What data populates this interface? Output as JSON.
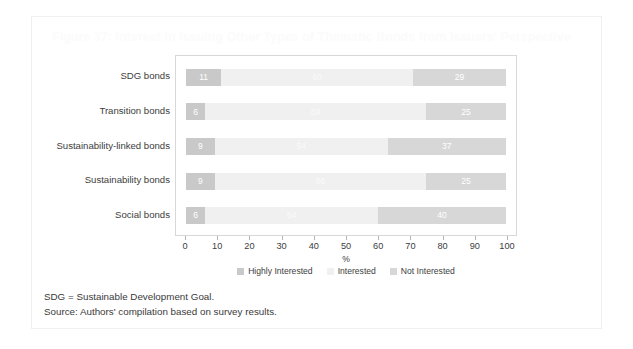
{
  "figure": {
    "title": "Figure 37: Interest in Issuing Other Types of Thematic Bonds from Issuers' Perspective",
    "notes": [
      "SDG = Sustainable Development Goal.",
      "Source: Authors' compilation based on survey results."
    ]
  },
  "colors": {
    "highly_interested": "#c9c9c9",
    "interested": "#f0f0f0",
    "not_interested": "#d7d7d7",
    "axis": "#b5b5b5",
    "text": "#3d3d3d",
    "title": "#fbfbfb",
    "panel_border": "#d8d8d8",
    "frame_border": "#f0f0f0",
    "background": "#ffffff"
  },
  "chart_data": {
    "type": "bar",
    "orientation": "horizontal",
    "stacked": true,
    "stack_total": 100,
    "title": "Figure 37: Interest in Issuing Other Types of Thematic Bonds from Issuers' Perspective",
    "xlabel": "%",
    "ylabel": "",
    "xlim": [
      0,
      100
    ],
    "grid": false,
    "legend_position": "bottom",
    "categories": [
      "SDG bonds",
      "Transition bonds",
      "Sustainability-linked bonds",
      "Sustainability bonds",
      "Social bonds"
    ],
    "xticks": [
      0,
      10,
      20,
      30,
      40,
      50,
      60,
      70,
      80,
      90,
      100
    ],
    "xticklabels": [
      "0",
      "10",
      "20",
      "30",
      "40",
      "50",
      "60",
      "70",
      "80",
      "90",
      "100"
    ],
    "series": [
      {
        "name": "Highly Interested",
        "color": "#c9c9c9",
        "values": [
          11,
          6,
          9,
          9,
          6
        ]
      },
      {
        "name": "Interested",
        "color": "#f0f0f0",
        "values": [
          60,
          69,
          54,
          66,
          54
        ]
      },
      {
        "name": "Not Interested",
        "color": "#d7d7d7",
        "values": [
          29,
          25,
          37,
          25,
          40
        ]
      }
    ],
    "rows": [
      {
        "category": "SDG bonds",
        "segments": [
          {
            "series": "Highly Interested",
            "value": 11,
            "label": "11"
          },
          {
            "series": "Interested",
            "value": 60,
            "label": "60"
          },
          {
            "series": "Not Interested",
            "value": 29,
            "label": "29"
          }
        ]
      },
      {
        "category": "Transition bonds",
        "segments": [
          {
            "series": "Highly Interested",
            "value": 6,
            "label": "6"
          },
          {
            "series": "Interested",
            "value": 69,
            "label": "69"
          },
          {
            "series": "Not Interested",
            "value": 25,
            "label": "25"
          }
        ]
      },
      {
        "category": "Sustainability-linked bonds",
        "segments": [
          {
            "series": "Highly Interested",
            "value": 9,
            "label": "9"
          },
          {
            "series": "Interested",
            "value": 54,
            "label": "54"
          },
          {
            "series": "Not Interested",
            "value": 37,
            "label": "37"
          }
        ]
      },
      {
        "category": "Sustainability bonds",
        "segments": [
          {
            "series": "Highly Interested",
            "value": 9,
            "label": "9"
          },
          {
            "series": "Interested",
            "value": 66,
            "label": "66"
          },
          {
            "series": "Not Interested",
            "value": 25,
            "label": "25"
          }
        ]
      },
      {
        "category": "Social bonds",
        "segments": [
          {
            "series": "Highly Interested",
            "value": 6,
            "label": "6"
          },
          {
            "series": "Interested",
            "value": 54,
            "label": "54"
          },
          {
            "series": "Not Interested",
            "value": 40,
            "label": "40"
          }
        ]
      }
    ],
    "legend": [
      {
        "label": "Highly Interested",
        "color": "#c9c9c9"
      },
      {
        "label": "Interested",
        "color": "#f0f0f0"
      },
      {
        "label": "Not Interested",
        "color": "#d7d7d7"
      }
    ]
  }
}
